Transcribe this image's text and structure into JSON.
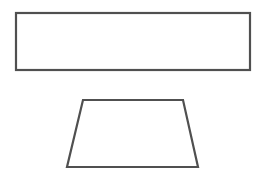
{
  "diagram": {
    "background": "#ffffff",
    "stroke_color": "#505050",
    "stroke_width": 2.2,
    "shapes": [
      {
        "type": "rectangle",
        "name": "rectangle",
        "x": 16,
        "y": 13,
        "width": 234,
        "height": 57
      },
      {
        "type": "trapezoid",
        "name": "trapezoid",
        "points": [
          [
            83,
            100
          ],
          [
            183,
            100
          ],
          [
            198,
            167
          ],
          [
            67,
            167
          ]
        ]
      }
    ]
  }
}
